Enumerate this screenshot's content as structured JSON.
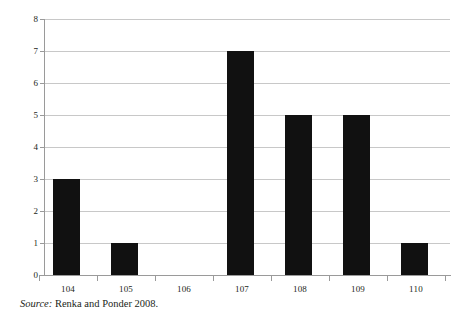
{
  "chart_data": {
    "type": "bar",
    "title": "",
    "subtitle": "",
    "xlabel": "",
    "ylabel": "",
    "categories": [
      "104",
      "105",
      "106",
      "107",
      "108",
      "109",
      "110"
    ],
    "values": [
      3,
      1,
      0,
      7,
      5,
      5,
      1
    ],
    "series": [
      {
        "name": "",
        "values": [
          3,
          1,
          0,
          7,
          5,
          5,
          1
        ]
      }
    ],
    "ylim": [
      0,
      8
    ],
    "y_ticks": [
      "8",
      "7",
      "6",
      "5",
      "4",
      "3",
      "2",
      "1",
      "0"
    ],
    "y_tick_values": [
      8,
      7,
      6,
      5,
      4,
      3,
      2,
      1,
      0
    ],
    "grid": true,
    "grid_axis": "y",
    "legend": false,
    "legend_position": "none",
    "bar_color": "#111111",
    "grid_color": "#c8c8c8",
    "axis_color": "#9a9a9a",
    "text_color": "#231f20",
    "annotations": []
  },
  "caption": {
    "source_word": "Source:",
    "source_text": "Renka and Ponder 2008."
  }
}
